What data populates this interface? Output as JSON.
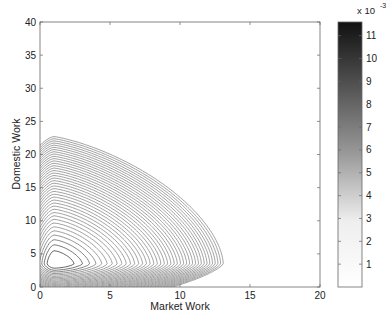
{
  "chart_data": {
    "type": "contour",
    "title": "",
    "xlabel": "Market Work",
    "ylabel": "Domestic Work",
    "xlim": [
      0,
      20
    ],
    "ylim": [
      0,
      40
    ],
    "xticks": [
      0,
      5,
      10,
      15,
      20
    ],
    "yticks": [
      0,
      5,
      10,
      15,
      20,
      25,
      30,
      35,
      40
    ],
    "colorbar": {
      "label_multiplier": "x 10",
      "label_exponent": "-3",
      "range": [
        0,
        11.6
      ],
      "ticks": [
        1,
        2,
        3,
        4,
        5,
        6,
        7,
        8,
        9,
        10,
        11
      ],
      "colormap": "gray_reversed"
    },
    "peak": {
      "x": 1,
      "y": 3.5,
      "value": 11.6
    },
    "outer_contours_x_extent_at_y0": [
      16,
      11,
      7
    ],
    "outer_contour_top_y_at_x0": [
      37.5,
      31,
      27.5,
      25
    ]
  },
  "labels": {
    "xlabel": "Market Work",
    "ylabel": "Domestic Work",
    "cb_mult": "x 10",
    "cb_exp": "-3"
  }
}
